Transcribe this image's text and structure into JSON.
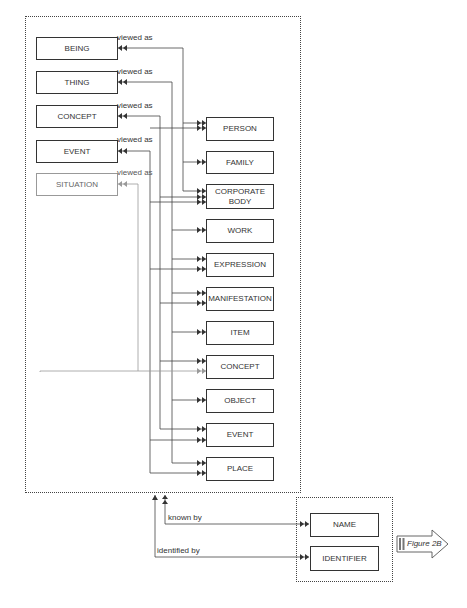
{
  "diagram": {
    "left_entities": [
      {
        "label": "BEING",
        "relation": "viewed as"
      },
      {
        "label": "THING",
        "relation": "viewed as"
      },
      {
        "label": "CONCEPT",
        "relation": "viewed as"
      },
      {
        "label": "EVENT",
        "relation": "viewed as"
      },
      {
        "label": "SITUATION",
        "relation": "viewed as"
      }
    ],
    "right_entities": [
      {
        "label": "PERSON"
      },
      {
        "label": "FAMILY"
      },
      {
        "label": "CORPORATE BODY",
        "line1": "CORPORATE",
        "line2": "BODY"
      },
      {
        "label": "WORK"
      },
      {
        "label": "EXPRESSION"
      },
      {
        "label": "MANIFESTATION"
      },
      {
        "label": "ITEM"
      },
      {
        "label": "CONCEPT"
      },
      {
        "label": "OBJECT"
      },
      {
        "label": "EVENT"
      },
      {
        "label": "PLACE"
      }
    ],
    "appellations": [
      {
        "label": "NAME",
        "relation": "known by"
      },
      {
        "label": "IDENTIFIER",
        "relation": "identified by"
      }
    ],
    "figure_link": "Figure 2B",
    "colors": {
      "line": "#333333",
      "grey_line": "#888888",
      "dotted": "#444444"
    }
  }
}
